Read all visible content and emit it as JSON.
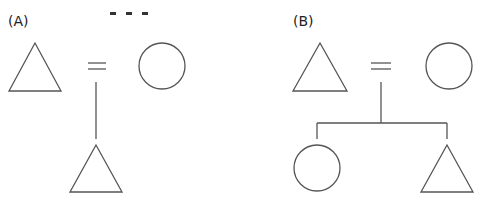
{
  "panels": [
    {
      "label": "(A)",
      "description": "Couple (male = female) with one son",
      "parents": [
        {
          "sex": "male",
          "symbol": "triangle"
        },
        {
          "sex": "female",
          "symbol": "circle"
        }
      ],
      "marriage_symbol": "=",
      "children": [
        {
          "sex": "male",
          "symbol": "triangle"
        }
      ]
    },
    {
      "label": "(B)",
      "description": "Couple (male = female) with a daughter and a son",
      "parents": [
        {
          "sex": "male",
          "symbol": "triangle"
        },
        {
          "sex": "female",
          "symbol": "circle"
        }
      ],
      "marriage_symbol": "=",
      "children": [
        {
          "sex": "female",
          "symbol": "circle"
        },
        {
          "sex": "male",
          "symbol": "triangle"
        }
      ]
    }
  ],
  "colors": {
    "stroke": "#555555",
    "background": "#ffffff",
    "text": "#222222"
  }
}
